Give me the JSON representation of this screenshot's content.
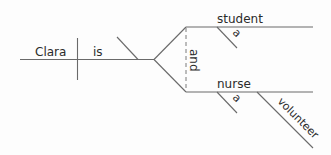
{
  "diagram": {
    "sentence_parts": {
      "subject": "Clara",
      "verb": "is",
      "conjunction": "and",
      "complements": [
        {
          "noun": "student",
          "modifiers": [
            "a"
          ]
        },
        {
          "noun": "nurse",
          "modifiers": [
            "a",
            "volunteer"
          ]
        }
      ]
    },
    "labels": {
      "subject": "Clara",
      "verb": "is",
      "conjunction": "and",
      "complement_1": "student",
      "complement_1_article": "a",
      "complement_2": "nurse",
      "complement_2_article": "a",
      "complement_2_modifier": "volunteer"
    },
    "colors": {
      "line": "#6a6a6a",
      "text": "#2b2b2b",
      "background": "#fdfdfd"
    }
  }
}
